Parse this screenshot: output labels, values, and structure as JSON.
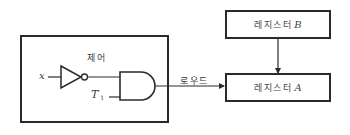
{
  "diagram": {
    "control_unit": {
      "label": "제어",
      "input_x_label": "x",
      "input_t_label": "T",
      "input_t_subscript": "1",
      "gates": [
        "inverter",
        "and-gate"
      ]
    },
    "signal": {
      "label": "로우드"
    },
    "register_b": {
      "label": "레지스터",
      "symbol": "B"
    },
    "register_a": {
      "label": "레지스터",
      "symbol": "A"
    },
    "connections": [
      {
        "from": "x",
        "to": "inverter"
      },
      {
        "from": "inverter",
        "to": "and-gate"
      },
      {
        "from": "T1",
        "to": "and-gate"
      },
      {
        "from": "and-gate",
        "to": "register_a",
        "label": "로우드"
      },
      {
        "from": "register_b",
        "to": "register_a"
      }
    ],
    "colors": {
      "stroke": "#2a2a2a",
      "background": "#ffffff"
    }
  }
}
